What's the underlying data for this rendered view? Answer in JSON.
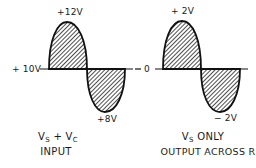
{
  "diagram": {
    "left_waveform": {
      "baseline_label": "+ 10V",
      "peak_label": "+12V",
      "trough_label": "+8V",
      "caption_line1": {
        "v1": "V",
        "s1": "S",
        "plus": " + ",
        "v2": "V",
        "s2": "C"
      },
      "caption_line2": "INPUT"
    },
    "right_waveform": {
      "baseline_label": "0",
      "peak_label": "+ 2V",
      "trough_label": "− 2V",
      "caption_line1": {
        "v": "V",
        "s": "S",
        "rest": " ONLY"
      },
      "caption_line2": "OUTPUT ACROSS R"
    },
    "colors": {
      "line": "#111111",
      "background": "#ffffff"
    }
  }
}
